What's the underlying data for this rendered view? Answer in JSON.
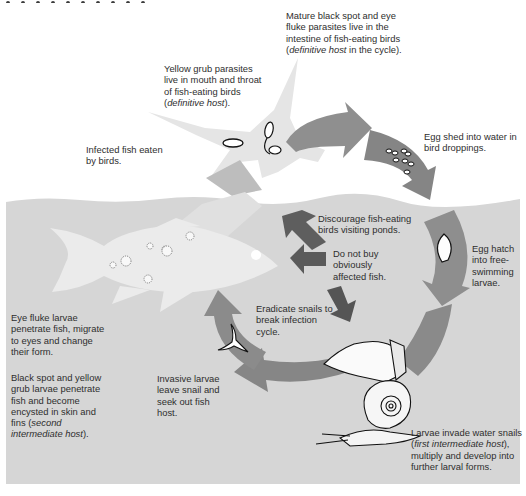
{
  "diagram": {
    "type": "parasite life cycle",
    "title_clipped": true,
    "colors": {
      "water": "#d6d6d6",
      "arrow_light": "#9a9a9a",
      "arrow_mid": "#8a8a8a",
      "arrow_dark": "#5a5a5a",
      "fish": "#ececec",
      "bird": "#e6e6e6",
      "text": "#2e2e2e"
    },
    "labels": {
      "mature_parasites": {
        "text": "Mature black spot and eye fluke parasites live in the intestine of fish-eating birds (",
        "italic": "definitive host",
        "tail": " in the cycle)."
      },
      "yellow_grub": {
        "text": "Yellow grub parasites live in mouth and throat of fish-eating birds (",
        "italic": "definitive host",
        "tail": ")."
      },
      "infected_fish": {
        "text": "Infected fish eaten by birds."
      },
      "egg_shed": {
        "text": "Egg shed into water in bird droppings."
      },
      "discourage_birds": {
        "text": "Discourage fish-eating birds visiting ponds."
      },
      "do_not_buy": {
        "text": "Do not buy obviously affected fish."
      },
      "egg_hatch": {
        "text": "Egg hatch into free-swimming larvae."
      },
      "eradicate_snails": {
        "text": "Eradicate snails to break infection cycle."
      },
      "eye_fluke": {
        "text": "Eye fluke larvae penetrate fish, migrate to eyes and change their form."
      },
      "black_spot": {
        "text": "Black spot and yellow grub larvae penetrate fish and become encysted in skin and fins (",
        "italic": "second intermediate host",
        "tail": ")."
      },
      "invasive_larvae": {
        "text": "Invasive larvae leave snail and seek out fish host."
      },
      "larvae_invade": {
        "text": "Larvae invade water snails (",
        "italic": "first intermediate host",
        "tail": "), multiply and develop into further larval forms."
      }
    }
  }
}
